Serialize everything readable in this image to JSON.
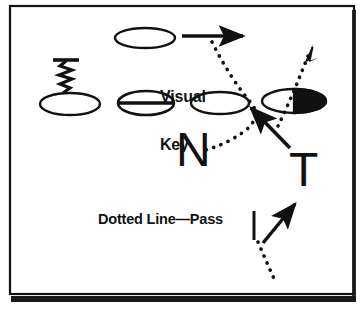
{
  "diagram": {
    "title": "Visual Key",
    "frame": {
      "border_color": "#000000",
      "background_color": "#ffffff",
      "shadow_color": "#111111"
    },
    "ink_color": "#111111",
    "labels": {
      "visual_key_line1": "Visual",
      "visual_key_line2": "Key",
      "legend_dotted_line_pass": "Dotted Line—Pass",
      "route_letter_n": "N",
      "route_letter_t": "T"
    },
    "players": [
      {
        "name": "player-top",
        "shape": "ellipse",
        "fill": "open",
        "cx": 145,
        "cy": 38,
        "rx": 30,
        "ry": 10
      },
      {
        "name": "player-left-motion",
        "shape": "ellipse",
        "fill": "open",
        "cx": 70,
        "cy": 104,
        "rx": 30,
        "ry": 11
      },
      {
        "name": "player-center-barred",
        "shape": "ellipse",
        "fill": "barred",
        "cx": 146,
        "cy": 103,
        "rx": 28,
        "ry": 12
      },
      {
        "name": "player-slot",
        "shape": "ellipse",
        "fill": "open",
        "cx": 220,
        "cy": 103,
        "rx": 29,
        "ry": 11
      },
      {
        "name": "player-half-filled",
        "shape": "ellipse",
        "fill": "half-right-black",
        "cx": 294,
        "cy": 101,
        "rx": 32,
        "ry": 12
      }
    ],
    "routes": [
      {
        "name": "motion-squiggle",
        "style": "zigzag",
        "description": "zigzag motion stem with T bar above left player"
      },
      {
        "name": "top-run-arrow",
        "style": "solid-arrow",
        "description": "horizontal solid arrow right from top player"
      },
      {
        "name": "pass-arc-dotted",
        "style": "dotted",
        "description": "dotted pass arc from upper right down across to N"
      },
      {
        "name": "dotted-up-right-arrow",
        "style": "dotted-arrow",
        "description": "dotted arrow up and right through half-filled player"
      },
      {
        "name": "solid-up-left-arrow",
        "style": "solid-arrow",
        "description": "solid arrow up-left toward slot player"
      },
      {
        "name": "legend-dotted-segment",
        "style": "dotted",
        "description": "legend sample dotted line from bottom"
      },
      {
        "name": "legend-solid-arrow",
        "style": "solid-arrow",
        "description": "legend sample solid arrow up-right"
      },
      {
        "name": "legend-tick-bar",
        "style": "vertical-bar",
        "description": "short vertical bar after the legend caption"
      }
    ]
  }
}
